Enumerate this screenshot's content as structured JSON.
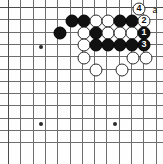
{
  "diagram": {
    "kind": "go-board-diagram",
    "board": {
      "cols": 13,
      "rows": 12,
      "origin_x": 8,
      "origin_y": 7,
      "spacing": 12.3,
      "line_color": "#6d6d6d",
      "edge_color": "#4a4a4a",
      "background": "#fefefe"
    },
    "star_points": [
      {
        "col": 0,
        "row": 0,
        "x": 41,
        "y": 47
      },
      {
        "col": 1,
        "row": 1,
        "x": 41,
        "y": 124
      },
      {
        "col": 2,
        "row": 2,
        "x": 115,
        "y": 124
      }
    ],
    "stones": [
      {
        "color": "black",
        "x": 72,
        "y": 21,
        "label": ""
      },
      {
        "color": "black",
        "x": 84,
        "y": 21,
        "label": ""
      },
      {
        "color": "white",
        "x": 96,
        "y": 21,
        "label": ""
      },
      {
        "color": "white",
        "x": 108,
        "y": 21,
        "label": ""
      },
      {
        "color": "black",
        "x": 120,
        "y": 21,
        "label": ""
      },
      {
        "color": "black",
        "x": 132,
        "y": 21,
        "label": ""
      },
      {
        "color": "white",
        "x": 144,
        "y": 21,
        "label": "2"
      },
      {
        "color": "white",
        "x": 139,
        "y": 9,
        "label": "4"
      },
      {
        "color": "black",
        "x": 60,
        "y": 33,
        "label": ""
      },
      {
        "color": "white",
        "x": 84,
        "y": 33,
        "label": ""
      },
      {
        "color": "black",
        "x": 96,
        "y": 33,
        "label": ""
      },
      {
        "color": "white",
        "x": 108,
        "y": 33,
        "label": ""
      },
      {
        "color": "white",
        "x": 120,
        "y": 33,
        "label": ""
      },
      {
        "color": "white",
        "x": 132,
        "y": 33,
        "label": ""
      },
      {
        "color": "black",
        "x": 144,
        "y": 33,
        "label": "1"
      },
      {
        "color": "white",
        "x": 84,
        "y": 45,
        "label": ""
      },
      {
        "color": "black",
        "x": 96,
        "y": 45,
        "label": ""
      },
      {
        "color": "black",
        "x": 108,
        "y": 45,
        "label": ""
      },
      {
        "color": "black",
        "x": 120,
        "y": 45,
        "label": ""
      },
      {
        "color": "black",
        "x": 132,
        "y": 45,
        "label": ""
      },
      {
        "color": "black",
        "x": 144,
        "y": 45,
        "label": "3"
      },
      {
        "color": "white",
        "x": 84,
        "y": 58,
        "label": ""
      },
      {
        "color": "white",
        "x": 133,
        "y": 58,
        "label": ""
      },
      {
        "color": "white",
        "x": 146,
        "y": 58,
        "label": ""
      },
      {
        "color": "white",
        "x": 96,
        "y": 70,
        "label": ""
      },
      {
        "color": "white",
        "x": 122,
        "y": 70,
        "label": ""
      }
    ],
    "point_labels": [
      {
        "text": "a",
        "x": 155,
        "y": 9
      }
    ],
    "move_numbers": {
      "1": {
        "color": "black",
        "text": "1"
      },
      "2": {
        "color": "white",
        "text": "2"
      },
      "3": {
        "color": "black",
        "text": "3"
      },
      "4": {
        "color": "white",
        "text": "4"
      }
    }
  }
}
